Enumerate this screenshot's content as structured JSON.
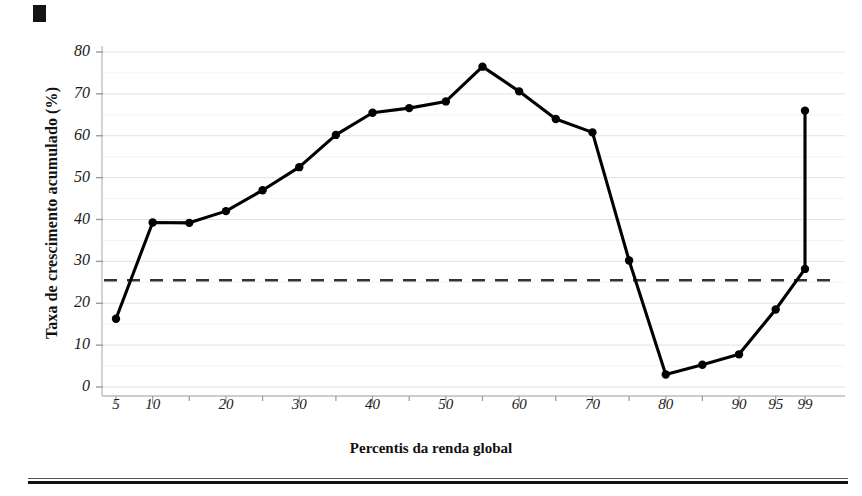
{
  "figure": {
    "corner_marker": "black-square-marker",
    "has_bottom_rule": true
  },
  "axes": {
    "y_title": "Taxa de crescimento acumulado (%)",
    "x_title": "Percentis da renda global",
    "y_ticks": [
      0,
      10,
      20,
      30,
      40,
      50,
      60,
      70,
      80
    ],
    "x_ticks": [
      5,
      10,
      20,
      30,
      40,
      50,
      60,
      70,
      80,
      90,
      95,
      99
    ]
  },
  "chart_data": {
    "type": "line",
    "title": "",
    "subtitle": "",
    "xlabel": "Percentis da renda global",
    "ylabel": "Taxa de crescimento acumulado (%)",
    "xlim": [
      2,
      101
    ],
    "ylim": [
      0,
      80
    ],
    "grid": true,
    "legend": "none",
    "x": [
      5,
      10,
      15,
      20,
      25,
      30,
      35,
      40,
      45,
      50,
      55,
      60,
      65,
      70,
      75,
      80,
      85,
      90,
      95,
      99
    ],
    "values": [
      16.3,
      39.3,
      39.2,
      42.0,
      47.0,
      52.5,
      60.2,
      65.5,
      66.6,
      68.2,
      76.5,
      70.6,
      64.0,
      60.8,
      30.2,
      3.0,
      5.3,
      7.8,
      18.5,
      28.2
    ],
    "series": [
      {
        "name": "Taxa de crescimento acumulado",
        "style": "solid-with-markers",
        "color": "#000000",
        "values": [
          16.3,
          39.3,
          39.2,
          42.0,
          47.0,
          52.5,
          60.2,
          65.5,
          66.6,
          68.2,
          76.5,
          70.6,
          64.0,
          60.8,
          30.2,
          3.0,
          5.3,
          7.8,
          18.5,
          28.2
        ]
      }
    ],
    "extra_point": {
      "x": 99,
      "y": 66.0,
      "label": "top-percentile-endpoint"
    },
    "reference_line": {
      "name": "media-global",
      "y": 25.5,
      "style": "dashed",
      "color": "#333333"
    },
    "annotations": []
  }
}
